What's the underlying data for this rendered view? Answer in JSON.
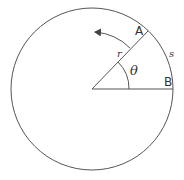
{
  "diagram": {
    "labels": {
      "point_a": "A",
      "point_b": "B",
      "radius": "r",
      "arc": "s",
      "angle": "θ"
    },
    "colors": {
      "stroke": "#444444",
      "background": "#ffffff"
    }
  }
}
